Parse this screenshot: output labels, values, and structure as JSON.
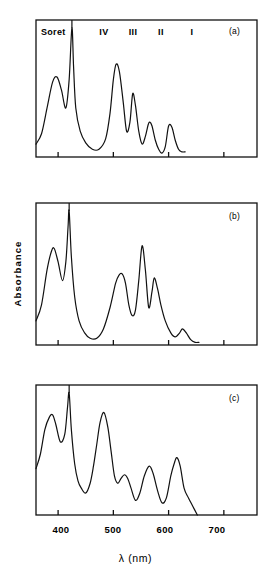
{
  "figure": {
    "axis": {
      "xlabel": "λ (nm)",
      "ylabel": "Absorbance",
      "xticks": [
        400,
        500,
        600,
        700
      ],
      "xtick_labels": [
        "400",
        "500",
        "600",
        "700"
      ],
      "xlim": [
        360,
        760
      ],
      "ylabel_text": "Absorbance"
    },
    "band_labels": {
      "soret": "Soret",
      "iv": "IV",
      "iii": "III",
      "ii": "II",
      "i": "I"
    },
    "panel_labels": {
      "a": "(a)",
      "b": "(b)",
      "c": "(c)"
    }
  },
  "chart_data": {
    "type": "line",
    "title": "",
    "xlabel": "λ (nm)",
    "ylabel": "Absorbance",
    "xlim": [
      360,
      760
    ],
    "ylim": [
      0,
      1
    ],
    "grid": false,
    "legend": null,
    "xticks": [
      400,
      500,
      600,
      700
    ],
    "annotations": [
      {
        "text": "Soret",
        "x": 385,
        "y": 0.93
      },
      {
        "text": "IV",
        "x": 505,
        "y": 0.93
      },
      {
        "text": "III",
        "x": 535,
        "y": 0.93
      },
      {
        "text": "II",
        "x": 565,
        "y": 0.93
      },
      {
        "text": "I",
        "x": 600,
        "y": 0.93
      },
      {
        "text": "(a)",
        "x": 725,
        "y": 0.93,
        "panel": "a"
      },
      {
        "text": "(b)",
        "x": 725,
        "y": 0.93,
        "panel": "b"
      },
      {
        "text": "(c)",
        "x": 725,
        "y": 0.93,
        "panel": "c"
      }
    ],
    "panels": [
      {
        "label": "(a)",
        "note": "Soret band truncated (off-scale) at ~425 nm",
        "peaks": [
          {
            "name": "Soret-shoulder",
            "x": 398,
            "y": 0.62
          },
          {
            "name": "Soret",
            "x": 425,
            "y": 1.0,
            "clipped": true
          },
          {
            "name": "IV",
            "x": 505,
            "y": 0.72
          },
          {
            "name": "III",
            "x": 535,
            "y": 0.49
          },
          {
            "name": "II",
            "x": 566,
            "y": 0.27
          },
          {
            "name": "I",
            "x": 600,
            "y": 0.24
          }
        ],
        "x": [
          360,
          370,
          380,
          390,
          398,
          406,
          414,
          420,
          425,
          428,
          432,
          440,
          450,
          462,
          474,
          486,
          494,
          500,
          505,
          511,
          518,
          524,
          530,
          535,
          540,
          546,
          552,
          558,
          563,
          566,
          570,
          576,
          582,
          588,
          594,
          600,
          606,
          612,
          618,
          624,
          630
        ],
        "y": [
          0.1,
          0.18,
          0.38,
          0.58,
          0.62,
          0.52,
          0.38,
          0.6,
          1.0,
          0.7,
          0.38,
          0.2,
          0.11,
          0.06,
          0.06,
          0.14,
          0.34,
          0.6,
          0.72,
          0.66,
          0.42,
          0.2,
          0.27,
          0.49,
          0.4,
          0.2,
          0.1,
          0.16,
          0.25,
          0.27,
          0.24,
          0.13,
          0.06,
          0.03,
          0.08,
          0.24,
          0.23,
          0.13,
          0.06,
          0.04,
          0.04
        ]
      },
      {
        "label": "(b)",
        "note": "Soret band truncated (off-scale) at ~420 nm",
        "peaks": [
          {
            "name": "Soret-shoulder",
            "x": 393,
            "y": 0.72
          },
          {
            "name": "Soret",
            "x": 420,
            "y": 1.0,
            "clipped": true
          },
          {
            "name": "Band-1",
            "x": 516,
            "y": 0.53
          },
          {
            "name": "Band-2",
            "x": 552,
            "y": 0.74
          },
          {
            "name": "Band-3",
            "x": 574,
            "y": 0.5
          },
          {
            "name": "Band-4",
            "x": 625,
            "y": 0.12
          }
        ],
        "x": [
          360,
          370,
          380,
          388,
          393,
          400,
          408,
          414,
          418,
          420,
          424,
          430,
          438,
          448,
          458,
          470,
          482,
          494,
          504,
          510,
          516,
          522,
          528,
          534,
          540,
          546,
          552,
          558,
          564,
          570,
          574,
          580,
          586,
          594,
          604,
          612,
          620,
          625,
          632,
          640,
          648,
          655
        ],
        "y": [
          0.18,
          0.3,
          0.56,
          0.7,
          0.72,
          0.62,
          0.48,
          0.62,
          0.88,
          1.0,
          0.66,
          0.36,
          0.18,
          0.09,
          0.05,
          0.05,
          0.12,
          0.28,
          0.46,
          0.52,
          0.53,
          0.46,
          0.3,
          0.22,
          0.26,
          0.48,
          0.74,
          0.56,
          0.28,
          0.4,
          0.5,
          0.42,
          0.3,
          0.18,
          0.09,
          0.06,
          0.09,
          0.12,
          0.09,
          0.04,
          0.02,
          0.02
        ]
      },
      {
        "label": "(c)",
        "note": "Soret band truncated (off-scale) at ~420 nm; trace runs off baseline at long wavelength",
        "peaks": [
          {
            "name": "Soret-shoulder",
            "x": 390,
            "y": 0.82
          },
          {
            "name": "Soret",
            "x": 420,
            "y": 1.0,
            "clipped": true
          },
          {
            "name": "Band-1",
            "x": 483,
            "y": 0.84
          },
          {
            "name": "Band-2",
            "x": 520,
            "y": 0.33
          },
          {
            "name": "Band-3",
            "x": 565,
            "y": 0.4
          },
          {
            "name": "Band-4",
            "x": 615,
            "y": 0.47
          }
        ],
        "x": [
          360,
          368,
          376,
          384,
          390,
          396,
          404,
          412,
          417,
          420,
          424,
          430,
          436,
          442,
          450,
          458,
          464,
          470,
          476,
          483,
          490,
          496,
          502,
          508,
          514,
          520,
          526,
          532,
          540,
          548,
          556,
          565,
          572,
          580,
          588,
          596,
          604,
          610,
          615,
          621,
          628,
          636,
          644,
          652
        ],
        "y": [
          0.38,
          0.5,
          0.7,
          0.8,
          0.82,
          0.74,
          0.6,
          0.66,
          0.88,
          1.0,
          0.7,
          0.42,
          0.28,
          0.22,
          0.18,
          0.26,
          0.4,
          0.58,
          0.76,
          0.84,
          0.72,
          0.52,
          0.32,
          0.26,
          0.3,
          0.33,
          0.3,
          0.22,
          0.12,
          0.18,
          0.32,
          0.4,
          0.34,
          0.2,
          0.1,
          0.14,
          0.32,
          0.42,
          0.47,
          0.4,
          0.22,
          0.14,
          0.07,
          0.0
        ]
      }
    ]
  }
}
